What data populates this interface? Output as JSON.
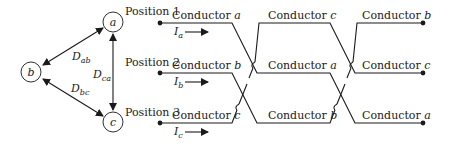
{
  "triangle": {
    "nodes": [
      {
        "id": "a",
        "label": "a",
        "x": 113,
        "y": 22
      },
      {
        "id": "b",
        "label": "b",
        "x": 31,
        "y": 72
      },
      {
        "id": "c",
        "label": "c",
        "x": 113,
        "y": 122
      }
    ],
    "distances": [
      {
        "main": "D",
        "sub": "ab"
      },
      {
        "main": "D",
        "sub": "ca"
      },
      {
        "main": "D",
        "sub": "bc"
      }
    ]
  },
  "positions": [
    {
      "label": "Position 1",
      "y": 23
    },
    {
      "label": "Position 2",
      "y": 73
    },
    {
      "label": "Position 3",
      "y": 123
    }
  ],
  "currents": [
    {
      "main": "I",
      "sub": "a"
    },
    {
      "main": "I",
      "sub": "b"
    },
    {
      "main": "I",
      "sub": "c"
    }
  ],
  "sections": [
    {
      "name": "section-1",
      "conductors": [
        {
          "prefix": "Conductor ",
          "id": "a"
        },
        {
          "prefix": "Conductor ",
          "id": "b"
        },
        {
          "prefix": "Conductor ",
          "id": "c"
        }
      ]
    },
    {
      "name": "section-2",
      "conductors": [
        {
          "prefix": "Conductor ",
          "id": "c"
        },
        {
          "prefix": "Conductor ",
          "id": "a"
        },
        {
          "prefix": "Conductor ",
          "id": "b"
        }
      ]
    },
    {
      "name": "section-3",
      "conductors": [
        {
          "prefix": "Conductor ",
          "id": "b"
        },
        {
          "prefix": "Conductor ",
          "id": "c"
        },
        {
          "prefix": "Conductor ",
          "id": "a"
        }
      ]
    }
  ],
  "colors": {
    "stroke": "#1a1a1a",
    "background": "#ffffff"
  }
}
